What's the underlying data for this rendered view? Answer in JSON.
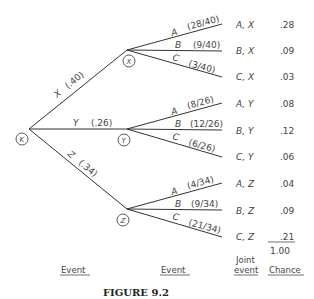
{
  "root": {
    "label": "K"
  },
  "first_level": [
    {
      "node": "X",
      "branch_label": "X",
      "prob": "(.40)"
    },
    {
      "node": "Y",
      "branch_label": "Y",
      "prob": "(.26)"
    },
    {
      "node": "Z",
      "branch_label": "Z",
      "prob": "(.34)"
    }
  ],
  "second_level": {
    "X": [
      {
        "label": "A",
        "prob": "(28/40)",
        "joint": "A, X",
        "chance": ".28"
      },
      {
        "label": "B",
        "prob": "(9/40)",
        "joint": "B, X",
        "chance": ".09"
      },
      {
        "label": "C",
        "prob": "(3/40)",
        "joint": "C, X",
        "chance": ".03"
      }
    ],
    "Y": [
      {
        "label": "A",
        "prob": "(8/26)",
        "joint": "A, Y",
        "chance": ".08"
      },
      {
        "label": "B",
        "prob": "(12/26)",
        "joint": "B, Y",
        "chance": ".12"
      },
      {
        "label": "C",
        "prob": "(6/26)",
        "joint": "C, Y",
        "chance": ".06"
      }
    ],
    "Z": [
      {
        "label": "A",
        "prob": "(4/34)",
        "joint": "A, Z",
        "chance": ".04"
      },
      {
        "label": "B",
        "prob": "(9/34)",
        "joint": "B, Z",
        "chance": ".09"
      },
      {
        "label": "C",
        "prob": "(21/34)",
        "joint": "C, Z",
        "chance": ".21"
      }
    ]
  },
  "total": "1.00",
  "headers": {
    "event1": "Event",
    "event2": "Event",
    "joint_line1": "Joint",
    "joint_line2": "event",
    "chance": "Chance"
  },
  "caption": "FIGURE 9.2"
}
